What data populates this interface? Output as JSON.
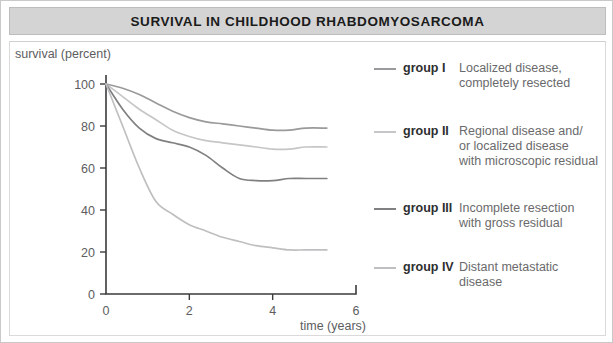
{
  "title": "SURVIVAL IN CHILDHOOD RHABDOMYOSARCOMA",
  "axes": {
    "ylabel": "survival (percent)",
    "xlabel": "time (years)"
  },
  "legend": [
    {
      "group": "group I",
      "desc": "Localized disease,\ncompletely resected",
      "color": "#9a9a9c"
    },
    {
      "group": "group II",
      "desc": "Regional disease and/\nor localized disease\nwith microscopic residual",
      "color": "#c6c6c8"
    },
    {
      "group": "group III",
      "desc": "Incomplete resection\nwith gross residual",
      "color": "#808082"
    },
    {
      "group": "group IV",
      "desc": "Distant metastatic\ndisease",
      "color": "#bfbfc1"
    }
  ],
  "chart_data": {
    "type": "line",
    "title": "SURVIVAL IN CHILDHOOD RHABDOMYOSARCOMA",
    "xlabel": "time (years)",
    "ylabel": "survival (percent)",
    "xlim": [
      0,
      6
    ],
    "ylim": [
      0,
      100
    ],
    "xticks": [
      0,
      2,
      4,
      6
    ],
    "xticks_minor": [
      1,
      3,
      5
    ],
    "yticks": [
      0,
      20,
      40,
      60,
      80,
      100
    ],
    "grid": false,
    "legend_position": "right",
    "series": [
      {
        "name": "group I",
        "label": "Localized disease, completely resected",
        "color": "#9a9a9c",
        "x": [
          0,
          0.4,
          0.8,
          1.2,
          1.6,
          2.0,
          2.4,
          2.8,
          3.2,
          3.6,
          4.0,
          4.4,
          4.8,
          5.3
        ],
        "y": [
          100,
          98,
          95,
          91,
          87,
          84,
          82,
          81,
          80,
          79,
          78,
          78,
          79,
          79
        ]
      },
      {
        "name": "group II",
        "label": "Regional disease and/or localized disease with microscopic residual",
        "color": "#c6c6c8",
        "x": [
          0,
          0.4,
          0.8,
          1.2,
          1.6,
          2.0,
          2.4,
          2.8,
          3.2,
          3.6,
          4.0,
          4.4,
          4.8,
          5.3
        ],
        "y": [
          100,
          94,
          88,
          83,
          78,
          75,
          73,
          72,
          71,
          70,
          69,
          69,
          70,
          70
        ]
      },
      {
        "name": "group III",
        "label": "Incomplete resection with gross residual",
        "color": "#808082",
        "x": [
          0,
          0.4,
          0.8,
          1.2,
          1.6,
          2.0,
          2.4,
          2.8,
          3.2,
          3.6,
          4.0,
          4.4,
          4.8,
          5.3
        ],
        "y": [
          100,
          88,
          79,
          74,
          72,
          70,
          66,
          60,
          55,
          54,
          54,
          55,
          55,
          55
        ]
      },
      {
        "name": "group IV",
        "label": "Distant metastatic disease",
        "color": "#bfbfc1",
        "x": [
          0,
          0.4,
          0.8,
          1.2,
          1.6,
          2.0,
          2.4,
          2.8,
          3.2,
          3.6,
          4.0,
          4.4,
          4.8,
          5.3
        ],
        "y": [
          100,
          80,
          60,
          44,
          38,
          33,
          30,
          27,
          25,
          23,
          22,
          21,
          21,
          21
        ]
      }
    ]
  }
}
